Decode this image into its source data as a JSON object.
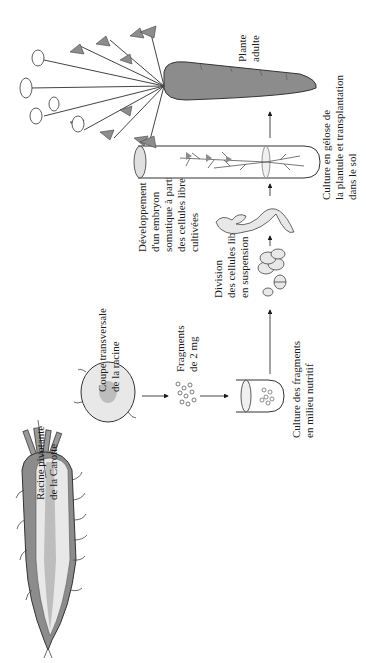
{
  "diagram": {
    "title": "",
    "orientation": "rotated-90-ccw",
    "colors": {
      "background": "#ffffff",
      "light_fill": "#e8e8e8",
      "mid_fill": "#bdbdbd",
      "dark_fill": "#8c8c8c",
      "outline": "#333333",
      "text": "#1a1a1a"
    },
    "steps": [
      {
        "id": "carrot-root",
        "label_lines": [
          "Racine pivotante",
          "de la Carotte"
        ]
      },
      {
        "id": "cross-section",
        "label_lines": [
          "Coupe transversale",
          "de la racine"
        ]
      },
      {
        "id": "fragments",
        "label_lines": [
          "Fragments",
          "de 2 mg"
        ]
      },
      {
        "id": "fragment-culture",
        "label_lines": [
          "Culture des fragments",
          "en milieu nutritif"
        ]
      },
      {
        "id": "cell-division",
        "label_lines": [
          "Division",
          "des cellules libres",
          "en suspension"
        ]
      },
      {
        "id": "somatic-embryo",
        "label_lines": [
          "Développement",
          "d'un embryon",
          "somatique à partir",
          "des cellules libres",
          "cultivées"
        ]
      },
      {
        "id": "agar-culture",
        "label_lines": [
          "Culture en gélose de",
          "la plantule et transplantation",
          "dans le sol"
        ]
      },
      {
        "id": "adult-plant",
        "label_lines": [
          "Plante",
          "adulte"
        ]
      }
    ]
  }
}
